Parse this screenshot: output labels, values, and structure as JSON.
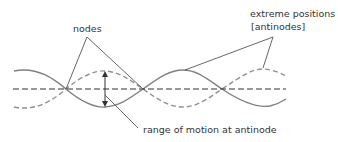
{
  "diagram": {
    "type": "standing-wave",
    "labels": {
      "nodes": "nodes",
      "extreme_positions_line1": "extreme positions",
      "extreme_positions_line2": "[antinodes]",
      "range": "range of motion at antinode"
    },
    "colors": {
      "wave": "#808080",
      "centerline": "#333333",
      "annotation_line": "#555555",
      "text": "#333333"
    }
  }
}
